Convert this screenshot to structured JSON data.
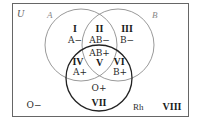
{
  "diagram": {
    "type": "venn",
    "universe_label": "U",
    "sets": [
      {
        "name": "A",
        "label": "A",
        "color": "#999999"
      },
      {
        "name": "B",
        "label": "B",
        "color": "#999999"
      },
      {
        "name": "Rh",
        "label": "Rh",
        "color": "#1a1a1a"
      }
    ],
    "regions": [
      {
        "id": "I",
        "roman": "I",
        "blood_type": "A−"
      },
      {
        "id": "II",
        "roman": "II",
        "blood_type": "AB−"
      },
      {
        "id": "III",
        "roman": "III",
        "blood_type": "B−"
      },
      {
        "id": "IV",
        "roman": "IV",
        "blood_type": "A+"
      },
      {
        "id": "V",
        "roman": "V",
        "blood_type": "AB+"
      },
      {
        "id": "VI",
        "roman": "VI",
        "blood_type": "B+"
      },
      {
        "id": "VII",
        "roman": "VII",
        "blood_type": "O+"
      },
      {
        "id": "VIII",
        "roman": "VIII",
        "blood_type": "O−"
      }
    ]
  }
}
